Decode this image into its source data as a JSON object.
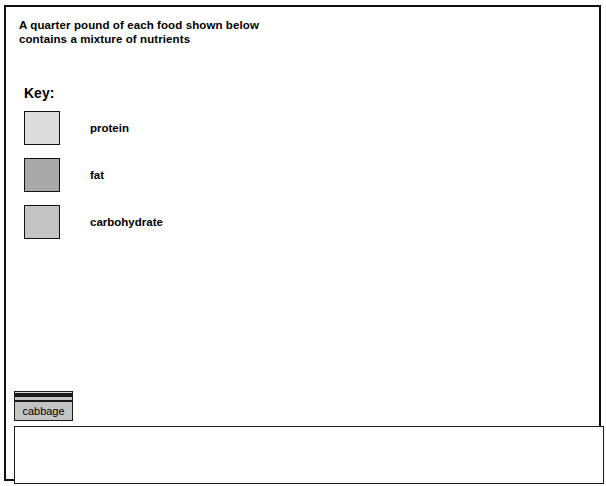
{
  "title": {
    "line1": "A quarter pound of each food shown below",
    "line2": "contains a mixture of nutrients"
  },
  "key": {
    "heading": "Key:",
    "items": [
      {
        "label": "protein",
        "color": "#dcdcdc"
      },
      {
        "label": "fat",
        "color": "#a8a8a8"
      },
      {
        "label": "carbohydrate",
        "color": "#c4c4c4"
      }
    ]
  },
  "colors": {
    "protein": "#dcdcdc",
    "fat": "#a8a8a8",
    "carbohydrate": "#c4c4c4",
    "outline": "#1b1b1b",
    "background": "#ffffff"
  },
  "chart_data": {
    "type": "bar",
    "subtype": "stacked",
    "title": "A quarter pound of each food shown below contains a mixture of nutrients",
    "xlabel": "",
    "ylabel": "",
    "grid": false,
    "legend_position": "top-left",
    "legend": [
      "protein",
      "fat",
      "carbohydrate"
    ],
    "categories": [
      "cabbage",
      "oranges",
      "milk",
      "eggs",
      "potatoes",
      "beef",
      "fish",
      "bread",
      "butter",
      "rice"
    ],
    "series": [
      {
        "name": "protein",
        "values": [
          3,
          4,
          20,
          57,
          8,
          58,
          52,
          36,
          6,
          30
        ]
      },
      {
        "name": "fat",
        "values": [
          2,
          4,
          16,
          33,
          3,
          62,
          53,
          8,
          313,
          8
        ]
      },
      {
        "name": "carbohydrate",
        "values": [
          5,
          20,
          6,
          0,
          53,
          0,
          0,
          137,
          0,
          317
        ]
      }
    ],
    "totals": [
      10,
      28,
      42,
      90,
      64,
      120,
      105,
      181,
      319,
      355
    ],
    "units": "relative bar height (pixels)",
    "icons": [
      "cabbage",
      "oranges",
      "milk",
      "eggs",
      "potatoes",
      "beef",
      "fish",
      "bread",
      "butter",
      "rice"
    ]
  }
}
